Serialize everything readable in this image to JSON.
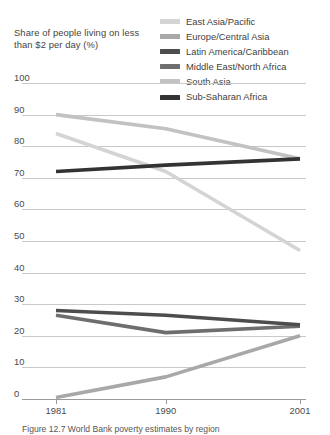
{
  "chart_data": {
    "type": "line",
    "title": "Share of people living on less than $2 per day (%)",
    "xlabel": "",
    "ylabel": "",
    "x": [
      "1981",
      "1990",
      "2001"
    ],
    "xlim": [
      1981,
      2001
    ],
    "ylim": [
      0,
      100
    ],
    "yticks": [
      100,
      90,
      80,
      70,
      60,
      50,
      40,
      30,
      20,
      10,
      0
    ],
    "grid": true,
    "legend_position": "top-right",
    "series": [
      {
        "name": "East Asia/Pacific",
        "color": "#d4d4d4",
        "values": [
          84.0,
          72.0,
          47.0
        ]
      },
      {
        "name": "Europe/Central Asia",
        "color": "#a8a8a8",
        "values": [
          0.5,
          7.0,
          20.0
        ]
      },
      {
        "name": "Latin America/Caribbean",
        "color": "#4d4d4d",
        "values": [
          28.0,
          26.5,
          23.5
        ]
      },
      {
        "name": "Middle East/North Africa",
        "color": "#6e6e6e",
        "values": [
          26.5,
          21.0,
          23.0
        ]
      },
      {
        "name": "South Asia",
        "color": "#c2c2c2",
        "values": [
          90.0,
          85.5,
          76.0
        ]
      },
      {
        "name": "Sub-Saharan Africa",
        "color": "#333333",
        "values": [
          72.0,
          74.0,
          76.0
        ]
      }
    ]
  },
  "caption": {
    "text": "Figure 12.7 World Bank poverty estimates by region"
  }
}
